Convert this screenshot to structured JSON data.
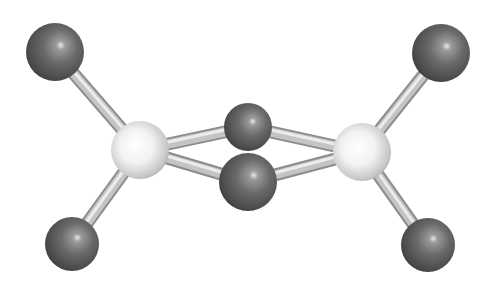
{
  "image": {
    "description": "Ball-and-stick molecular model: two light central atoms bridged by two dark atoms, each light atom bonded to two terminal dark atoms",
    "background": "#ffffff",
    "colors": {
      "dark_atom": "#5a5a5a",
      "dark_atom_highlight": "#dcdcdc",
      "light_atom": "#e6e6e6",
      "light_atom_highlight": "#ffffff",
      "bond": "#c4c4c4"
    }
  },
  "atoms": [
    {
      "id": "terminal-top-left",
      "type": "dark",
      "cx": 55,
      "cy": 52,
      "r": 29
    },
    {
      "id": "terminal-top-right",
      "type": "dark",
      "cx": 441,
      "cy": 53,
      "r": 29
    },
    {
      "id": "terminal-bottom-left",
      "type": "dark",
      "cx": 72,
      "cy": 244,
      "r": 27
    },
    {
      "id": "terminal-bottom-right",
      "type": "dark",
      "cx": 428,
      "cy": 245,
      "r": 27
    },
    {
      "id": "center-left",
      "type": "light",
      "cx": 140,
      "cy": 150,
      "r": 29
    },
    {
      "id": "center-right",
      "type": "light",
      "cx": 362,
      "cy": 152,
      "r": 29
    },
    {
      "id": "bridge-top",
      "type": "dark",
      "cx": 248,
      "cy": 127,
      "r": 24
    },
    {
      "id": "bridge-bottom",
      "type": "dark",
      "cx": 248,
      "cy": 182,
      "r": 29
    }
  ],
  "bonds": [
    [
      "center-left",
      "terminal-top-left"
    ],
    [
      "center-left",
      "terminal-bottom-left"
    ],
    [
      "center-right",
      "terminal-top-right"
    ],
    [
      "center-right",
      "terminal-bottom-right"
    ],
    [
      "center-left",
      "bridge-top"
    ],
    [
      "center-right",
      "bridge-top"
    ],
    [
      "center-left",
      "bridge-bottom"
    ],
    [
      "center-right",
      "bridge-bottom"
    ]
  ]
}
